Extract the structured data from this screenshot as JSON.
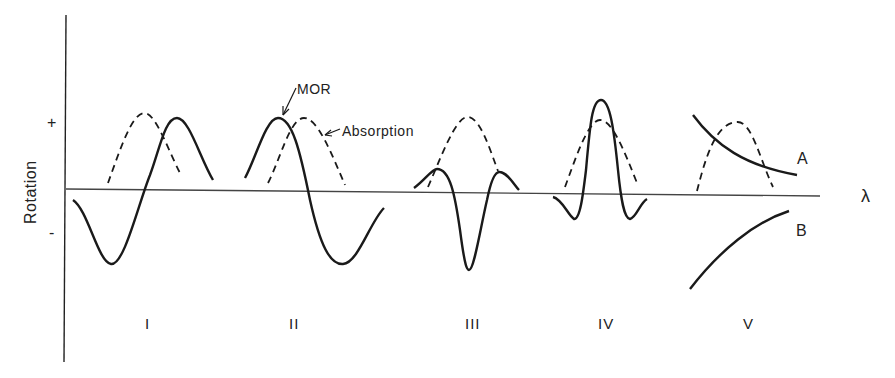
{
  "figure": {
    "y_axis_label": "Rotation",
    "y_plus": "+",
    "y_minus": "-",
    "x_axis_symbol": "λ",
    "annotations": {
      "mor": "MOR",
      "absorption": "Absorption"
    },
    "panels": [
      {
        "label": "I",
        "description": "Positive Cotton effect: MOR trough at shorter wavelength, peak at longer wavelength; absorption band centered between"
      },
      {
        "label": "II",
        "description": "Negative Cotton effect: MOR peak at shorter wavelength, trough at longer wavelength"
      },
      {
        "label": "III",
        "description": "Negative Cotton effect with small positive lobes on either side, deep trough at absorption maximum"
      },
      {
        "label": "IV",
        "description": "Positive Cotton effect with large peak at absorption maximum and small negative lobes"
      },
      {
        "label": "V",
        "description": "Plain dispersion curves A (positive, decreasing) and B (negative, increasing) across absorption band"
      }
    ],
    "curve_labels": {
      "a": "A",
      "b": "B"
    },
    "line_styles": {
      "mor": "solid",
      "absorption": "dashed"
    },
    "colors": {
      "ink": "#1a1a1a",
      "axis": "#444444",
      "background": "#ffffff"
    }
  }
}
